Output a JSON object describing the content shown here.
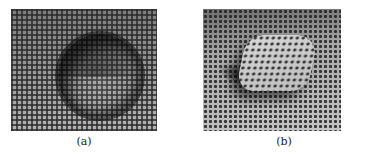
{
  "figure": {
    "panels": [
      {
        "id": "a",
        "caption": "(a)",
        "description": "Grid-patterned surface with a circular ring-shaped depression"
      },
      {
        "id": "b",
        "caption": "(b)",
        "description": "Dotted-pattern surface with a raised rounded-square bump"
      }
    ]
  }
}
